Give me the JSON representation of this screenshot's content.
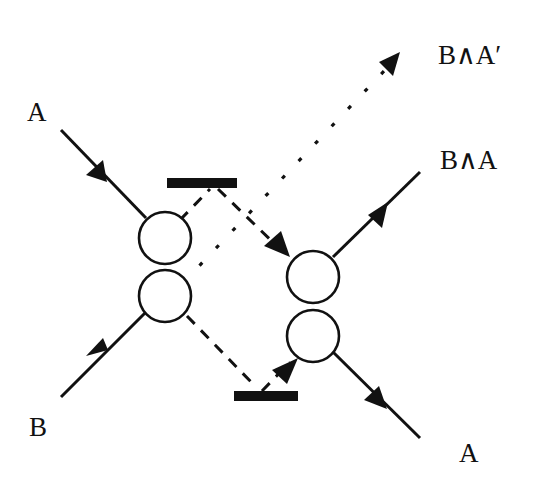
{
  "diagram": {
    "type": "quantum-circuit-swap-interference",
    "labels": {
      "input_top": "A",
      "input_bottom": "B",
      "output_dotted": "B∧A′",
      "output_top": "B∧A",
      "output_bottom": "A"
    },
    "elements": {
      "left_nodes": [
        "upper-circle",
        "lower-circle"
      ],
      "right_nodes": [
        "upper-circle",
        "lower-circle"
      ],
      "mirrors": [
        "top-bar",
        "bottom-bar"
      ],
      "paths": {
        "solid": [
          "A-in",
          "B-in",
          "B∧A-out",
          "A-out"
        ],
        "dashed": [
          "left-upper-to-top-bar-to-right-upper",
          "left-lower-to-bottom-bar-to-right-lower"
        ],
        "dotted": [
          "left-lower-to-B∧A′"
        ]
      }
    },
    "colors": {
      "ink": "#111111",
      "background": "#ffffff"
    }
  }
}
